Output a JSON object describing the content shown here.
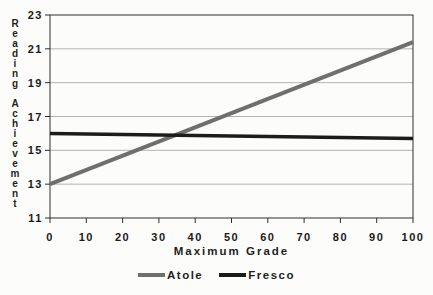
{
  "figure": {
    "background": "#fcfcfb",
    "axis_color": "#2e2e2e",
    "grid_color": "#b4b4b4",
    "text_color": "#1a1a1a"
  },
  "chart_data": {
    "type": "line",
    "title": "",
    "xlabel": "Maximum Grade",
    "ylabel": "Reading Achievement",
    "ylabel_words": [
      "Reading",
      "Achievement"
    ],
    "xlim": [
      0,
      100
    ],
    "ylim": [
      11,
      23
    ],
    "xticks": [
      0,
      10,
      20,
      30,
      40,
      50,
      60,
      70,
      80,
      90,
      100
    ],
    "yticks": [
      11,
      13,
      15,
      17,
      19,
      21,
      23
    ],
    "grid": "horizontal",
    "legend_position": "bottom",
    "x": [
      0,
      100
    ],
    "series": [
      {
        "name": "Atole",
        "values": [
          13.0,
          21.4
        ],
        "color": "#6f6f6f",
        "width": 4
      },
      {
        "name": "Fresco",
        "values": [
          16.0,
          15.7
        ],
        "color": "#1c1c1c",
        "width": 3.5
      }
    ]
  }
}
